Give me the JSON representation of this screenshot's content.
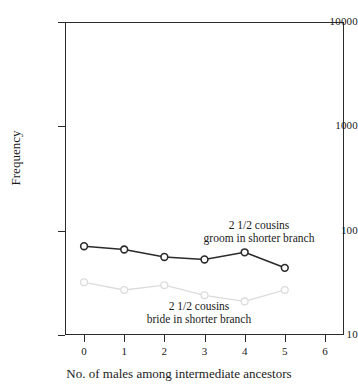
{
  "chart_data": {
    "type": "line",
    "title": "",
    "xlabel": "No. of males among intermediate ancestors",
    "ylabel": "Frequency",
    "x": [
      0,
      1,
      2,
      3,
      4,
      5
    ],
    "xlim": [
      -0.475,
      6.475
    ],
    "xticks": [
      0,
      1,
      2,
      3,
      4,
      5,
      6
    ],
    "xtick_labels": [
      "0",
      "1",
      "2",
      "3",
      "4",
      "5",
      "6"
    ],
    "yscale": "log",
    "ylim": [
      10,
      10000
    ],
    "yticks": [
      10,
      100,
      1000,
      10000
    ],
    "ytick_labels": [
      "10",
      "100",
      "1000",
      "10000"
    ],
    "grid": false,
    "legend": "inline-annotations",
    "series": [
      {
        "name": "2 1/2 cousins groom in shorter branch",
        "color": "#2b2b2b",
        "marker": "open-circle",
        "values": [
          71,
          66,
          56,
          53,
          62,
          44
        ]
      },
      {
        "name": "2 1/2 cousins bride in shorter branch",
        "color": "#dcdcdc",
        "marker": "open-circle",
        "values": [
          32,
          27,
          30,
          24,
          21,
          27
        ]
      }
    ],
    "annotations": [
      {
        "name": "groom-annotation",
        "line1": "2 1/2 cousins",
        "line2": "groom  in shorter branch"
      },
      {
        "name": "bride-annotation",
        "line1": "2 1/2 cousins",
        "line2": "bride in shorter branch"
      }
    ]
  },
  "axes": {
    "y_title": "Frequency",
    "x_title": "No. of males among intermediate ancestors",
    "y_labels": [
      "10000",
      "1000",
      "100",
      "10"
    ],
    "x_labels": [
      "0",
      "1",
      "2",
      "3",
      "4",
      "5",
      "6"
    ]
  },
  "annotations": {
    "groom": {
      "line1": "2 1/2 cousins",
      "line2": "groom  in shorter branch"
    },
    "bride": {
      "line1": "2 1/2 cousins",
      "line2": "bride in shorter branch"
    }
  },
  "colors": {
    "axis": "#2b2b2b",
    "series_dark": "#2b2b2b",
    "series_light": "#dcdcdc",
    "background": "#ffffff"
  }
}
